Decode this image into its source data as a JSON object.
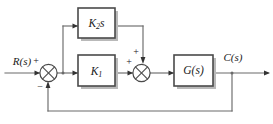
{
  "diagram": {
    "type": "control-system-block-diagram",
    "input_signal": {
      "label": "R(s)",
      "name": "reference-input"
    },
    "output_signal": {
      "label": "C(s)",
      "name": "output-signal"
    },
    "blocks": [
      {
        "id": "gain-k2s",
        "base": "K",
        "subscript": "2",
        "suffix": "s",
        "label": "K2s"
      },
      {
        "id": "gain-k1",
        "base": "K",
        "subscript": "1",
        "suffix": "",
        "label": "K1"
      },
      {
        "id": "plant-g",
        "base": "G(s)",
        "subscript": "",
        "suffix": "",
        "label": "G(s)"
      }
    ],
    "summing_junctions": [
      {
        "id": "summer-1",
        "input_left_sign": "+",
        "input_bottom_sign": "−"
      },
      {
        "id": "summer-2",
        "input_left_sign": "+",
        "input_top_sign": "+"
      }
    ],
    "signs": {
      "plus": "+",
      "minus": "−"
    },
    "colors": {
      "background": "#ffffff",
      "block_border": "#4a4a4a",
      "block_shadow": "#b9b9b9",
      "wire": "#6b6b6b",
      "text": "#1a1a1a"
    }
  }
}
